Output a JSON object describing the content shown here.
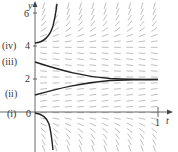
{
  "figure": {
    "axes": {
      "x_label": "t",
      "y_label": "y",
      "x_ticks": [
        {
          "value": 1,
          "label": "1"
        }
      ],
      "y_ticks": [
        {
          "value": 0,
          "label": "0"
        },
        {
          "value": 2,
          "label": "2"
        },
        {
          "value": 4,
          "label": "4"
        },
        {
          "value": 6,
          "label": "6"
        }
      ]
    },
    "curve_labels": [
      {
        "id": "i",
        "label": "(i)",
        "initial_y": 0
      },
      {
        "id": "ii",
        "label": "(ii)",
        "initial_y": 1
      },
      {
        "id": "iii",
        "label": "(iii)",
        "initial_y": 3
      },
      {
        "id": "iv",
        "label": "(iv)",
        "initial_y": 4
      }
    ],
    "equilibrium_y": 2,
    "colors": {
      "curve": "#222222",
      "slope_marks": "#b8b8b8",
      "axis": "#555555",
      "text": "#333333"
    }
  }
}
